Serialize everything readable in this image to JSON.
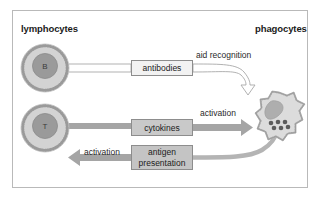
{
  "figure": {
    "frame_border_color": "#b9b9b9",
    "background": "#ffffff"
  },
  "headers": {
    "left": "lymphocytes",
    "right": "phagocytes"
  },
  "cells": [
    {
      "id": "b-cell",
      "label": "B",
      "type": "lymphocyte",
      "cytoplasm_color": "#d3d3d3",
      "nucleus_color": "#9a9a9a",
      "cx": 45,
      "cy": 68,
      "r": 24
    },
    {
      "id": "t-cell",
      "label": "T",
      "type": "lymphocyte",
      "cytoplasm_color": "#d3d3d3",
      "nucleus_color": "#9a9a9a",
      "cx": 45,
      "cy": 128,
      "r": 24
    },
    {
      "id": "phagocyte",
      "label": "",
      "type": "phagocyte",
      "cytoplasm_color": "#dcdcdc",
      "nucleus_color": "#aeaeae",
      "granule_color": "#5c5c5c",
      "granule_count": 6,
      "cx": 279,
      "cy": 122,
      "r": 30
    }
  ],
  "boxes": {
    "antibodies": {
      "label": "antibodies",
      "fill": "#f2f2f2",
      "border": "#8d8d8d"
    },
    "cytokines": {
      "label": "cytokines",
      "fill": "#c9c9c9",
      "border": "#8d8d8d"
    },
    "antigen_presentation": {
      "line1": "antigen",
      "line2": "presentation",
      "fill": "#c4c4c4",
      "border": "#8d8d8d"
    }
  },
  "annotations": {
    "aid_recognition": "aid recognition",
    "activation_right": "activation",
    "activation_left": "activation"
  },
  "arrows": [
    {
      "id": "antibodies-arrow",
      "from": "b-cell",
      "to": "phagocyte",
      "style": "outline",
      "label": "aid recognition",
      "via_box": "antibodies",
      "color": "#ffffff",
      "stroke": "#a8a8a8"
    },
    {
      "id": "cytokines-arrow",
      "from": "t-cell",
      "to": "phagocyte",
      "style": "solid",
      "label": "activation",
      "via_box": "cytokines",
      "color": "#a5a5a5"
    },
    {
      "id": "antigen-presentation-arrow",
      "from": "phagocyte",
      "to": "t-cell",
      "style": "solid",
      "label": "activation",
      "via_box": "antigen_presentation",
      "color": "#a5a5a5"
    }
  ]
}
